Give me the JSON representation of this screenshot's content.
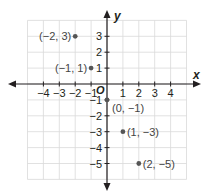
{
  "chart_data": {
    "type": "scatter",
    "title": "",
    "xlabel": "x",
    "ylabel": "y",
    "origin_label": "O",
    "xlim": [
      -5,
      5
    ],
    "ylim": [
      -6,
      4
    ],
    "grid": true,
    "x_ticks": [
      -4,
      -3,
      -2,
      -1,
      1,
      2,
      3,
      4
    ],
    "y_ticks": [
      3,
      2,
      1,
      -1,
      -2,
      -3,
      -4,
      -5
    ],
    "x_tick_labels": [
      "−4",
      "−3",
      "−2",
      "−1",
      "1",
      "2",
      "3",
      "4"
    ],
    "y_tick_labels": [
      "3",
      "2",
      "1",
      "−1",
      "−2",
      "−3",
      "−4",
      "−5"
    ],
    "points": [
      {
        "x": -2,
        "y": 3,
        "label": "(−2, 3)",
        "label_side": "left"
      },
      {
        "x": -1,
        "y": 1,
        "label": "(−1, 1)",
        "label_side": "left"
      },
      {
        "x": 0,
        "y": -1,
        "label": "(0, −1)",
        "label_side": "right-below"
      },
      {
        "x": 1,
        "y": -3,
        "label": "(1, −3)",
        "label_side": "right"
      },
      {
        "x": 2,
        "y": -5,
        "label": "(2, −5)",
        "label_side": "right"
      }
    ]
  },
  "colors": {
    "grid": "#d9d9d9",
    "axis": "#231f20",
    "point": "#555555",
    "text": "#231f20",
    "point_label": "#444444"
  }
}
